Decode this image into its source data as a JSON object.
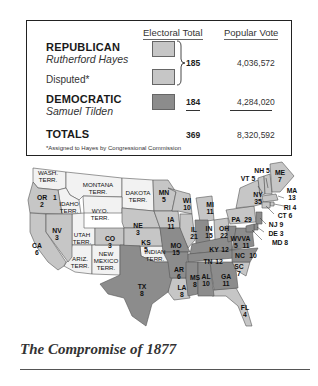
{
  "legend": {
    "headers": {
      "electoral_total": "Electoral Total",
      "popular_vote": "Popular Vote"
    },
    "republican": {
      "party": "REPUBLICAN",
      "candidate": "Rutherford Hayes",
      "color": "#c6c6c6",
      "popular_vote": "4,036,572"
    },
    "disputed": {
      "label": "Disputed*",
      "color": "#c6c6c6"
    },
    "republican_electoral_total": "185",
    "democratic": {
      "party": "DEMOCRATIC",
      "candidate": "Samuel Tilden",
      "color": "#8c8c8c",
      "electoral_total": "184",
      "popular_vote": "4,284,020"
    },
    "totals": {
      "label": "TOTALS",
      "electoral_total": "369",
      "popular_vote": "8,320,592"
    },
    "footnote": "*Assigned to Hayes by Congressional Commission"
  },
  "map": {
    "territories": [
      {
        "id": "wash",
        "label": "WASH.",
        "label2": "TERR."
      },
      {
        "id": "montana",
        "label": "MONTANA",
        "label2": "TERR."
      },
      {
        "id": "dakota",
        "label": "DAKOTA",
        "label2": "TERR."
      },
      {
        "id": "idaho",
        "label": "IDAHO",
        "label2": "TERR."
      },
      {
        "id": "wyo",
        "label": "WYO.",
        "label2": "TERR."
      },
      {
        "id": "utah",
        "label": "UTAH",
        "label2": "TERR."
      },
      {
        "id": "ariz",
        "label": "ARIZ.",
        "label2": "TERR."
      },
      {
        "id": "newmex",
        "label": "NEW",
        "label2": "MEXICO",
        "label3": "TERR."
      },
      {
        "id": "indian",
        "label": "INDIAN",
        "label2": "TERR."
      }
    ],
    "states": {
      "OR": {
        "abbr": "OR",
        "ev": "2"
      },
      "OR_disputed": {
        "ev": "1"
      },
      "CA": {
        "abbr": "CA",
        "ev": "6"
      },
      "NV": {
        "abbr": "NV",
        "ev": "3"
      },
      "CO": {
        "abbr": "CO",
        "ev": "3"
      },
      "NE": {
        "abbr": "NE",
        "ev": "3"
      },
      "KS": {
        "abbr": "KS",
        "ev": "5"
      },
      "TX": {
        "abbr": "TX",
        "ev": "8"
      },
      "MN": {
        "abbr": "MN",
        "ev": "5"
      },
      "IA": {
        "abbr": "IA",
        "ev": "11"
      },
      "MO": {
        "abbr": "MO",
        "ev": "15"
      },
      "AR": {
        "abbr": "AR",
        "ev": "6"
      },
      "LA": {
        "abbr": "LA",
        "ev": "8"
      },
      "WI": {
        "abbr": "WI",
        "ev": "10"
      },
      "IL": {
        "abbr": "IL",
        "ev": "21"
      },
      "MS": {
        "abbr": "MS",
        "ev": "8"
      },
      "MI": {
        "abbr": "MI",
        "ev": "11"
      },
      "IN": {
        "abbr": "IN",
        "ev": "15"
      },
      "KY": {
        "abbr": "KY",
        "ev": "12"
      },
      "TN": {
        "abbr": "TN",
        "ev": "12"
      },
      "AL": {
        "abbr": "AL",
        "ev": "10"
      },
      "OH": {
        "abbr": "OH",
        "ev": "22"
      },
      "WV": {
        "abbr": "WV",
        "ev": "5"
      },
      "VA": {
        "abbr": "VA",
        "ev": "11"
      },
      "NC": {
        "abbr": "NC",
        "ev": "10"
      },
      "SC": {
        "abbr": "SC",
        "ev": "7"
      },
      "GA": {
        "abbr": "GA",
        "ev": "11"
      },
      "FL": {
        "abbr": "FL",
        "ev": "4"
      },
      "PA": {
        "abbr": "PA",
        "ev": "29"
      },
      "NY": {
        "abbr": "NY",
        "ev": "35"
      },
      "VT": {
        "text": "VT 5"
      },
      "NH": {
        "text": "NH 5"
      },
      "ME": {
        "abbr": "ME",
        "ev": "7"
      },
      "MA": {
        "abbr": "MA",
        "ev": "13"
      },
      "RI": {
        "text": "RI 4"
      },
      "CT": {
        "text": "CT 6"
      },
      "NJ": {
        "text": "NJ 9"
      },
      "DE": {
        "text": "DE 3"
      },
      "MD": {
        "text": "MD 8"
      }
    },
    "colors": {
      "territory": "#f2f2f2",
      "republican": "#c6c6c6",
      "disputed": "#d4d4d4",
      "democratic": "#8c8c8c",
      "border": "#555555"
    }
  },
  "caption": "The Compromise of 1877"
}
